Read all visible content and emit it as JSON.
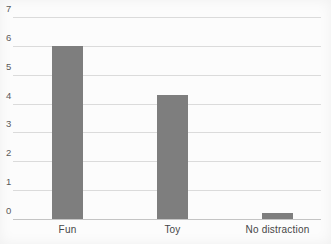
{
  "chart_data": {
    "type": "bar",
    "categories": [
      "Fun",
      "Toy",
      "No distraction"
    ],
    "values": [
      6,
      4.3,
      0.2
    ],
    "ylim": [
      0,
      7
    ],
    "yticks": [
      0,
      1,
      2,
      3,
      4,
      5,
      6,
      7
    ],
    "grid": true,
    "legend": false,
    "colors": {
      "bar": "#7e7e7e",
      "gridline": "#dbdbdb",
      "baseline": "#c4c4c4",
      "ytick_label": "#5a5a5a",
      "category_label": "#464646",
      "background": "#fcfcfc"
    }
  }
}
